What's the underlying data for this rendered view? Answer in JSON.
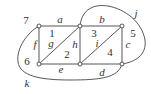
{
  "diagram": {
    "type": "planar-graph",
    "nodes": [
      {
        "id": "n1",
        "x": 39,
        "y": 26
      },
      {
        "id": "n2",
        "x": 80,
        "y": 26
      },
      {
        "id": "n3",
        "x": 122,
        "y": 26
      },
      {
        "id": "n4",
        "x": 39,
        "y": 64
      },
      {
        "id": "n5",
        "x": 80,
        "y": 64
      },
      {
        "id": "n6",
        "x": 122,
        "y": 64
      }
    ],
    "edges": [
      {
        "label": "a",
        "from": "n1",
        "to": "n2"
      },
      {
        "label": "b",
        "from": "n2",
        "to": "n3"
      },
      {
        "label": "c",
        "from": "n3",
        "to": "n6"
      },
      {
        "label": "d",
        "from": "n5",
        "to": "n6"
      },
      {
        "label": "e",
        "from": "n4",
        "to": "n5"
      },
      {
        "label": "f",
        "from": "n1",
        "to": "n4"
      },
      {
        "label": "g",
        "from": "n4",
        "to": "n2"
      },
      {
        "label": "h",
        "from": "n2",
        "to": "n5"
      },
      {
        "label": "i",
        "from": "n5",
        "to": "n3"
      },
      {
        "label": "j",
        "from": "n2",
        "to": "n6",
        "curved": true
      },
      {
        "label": "k",
        "from": "n1",
        "to": "n6",
        "curved": true
      }
    ],
    "edge_labels": {
      "a": "a",
      "b": "b",
      "c": "c",
      "d": "d",
      "e": "e",
      "f": "f",
      "g": "g",
      "h": "h",
      "i": "i",
      "j": "j",
      "k": "k"
    },
    "face_labels": {
      "f1": "1",
      "f2": "2",
      "f3": "3",
      "f4": "4",
      "f5": "5",
      "f6": "6",
      "f7": "7"
    }
  }
}
